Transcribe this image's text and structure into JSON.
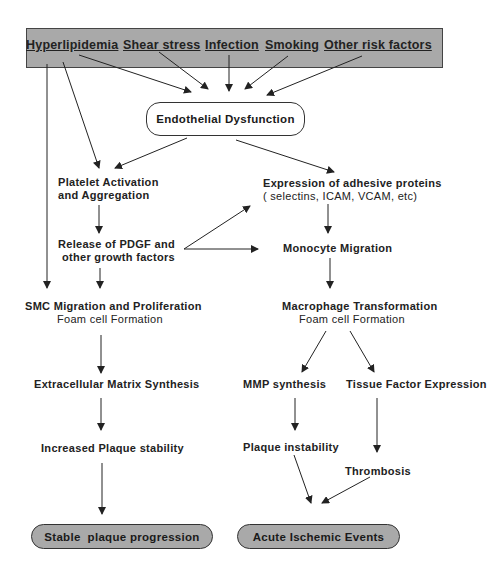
{
  "diagram": {
    "risk_factors": [
      {
        "label": "Hyperlipidemia"
      },
      {
        "label": "Shear stress"
      },
      {
        "label": "Infection"
      },
      {
        "label": "Smoking"
      },
      {
        "label": "Other risk factors"
      }
    ],
    "colors": {
      "box_fill": "#a9a9a9",
      "line": "#222222"
    },
    "endothelial": "Endothelial Dysfunction",
    "platelet": {
      "line1": "Platelet Activation",
      "line2": "and Aggregation"
    },
    "pdgf": {
      "line1": "Release of PDGF and",
      "line2": "other growth factors"
    },
    "adhesive": {
      "line1": "Expression of adhesive proteins",
      "line2": "( selectins, ICAM, VCAM, etc)"
    },
    "monocyte": "Monocyte Migration",
    "smc": {
      "line1": "SMC Migration and Proliferation",
      "line2": "Foam cell Formation"
    },
    "macrophage": {
      "line1": "Macrophage Transformation",
      "line2": "Foam cell Formation"
    },
    "ecm": "Extracellular Matrix Synthesis",
    "mmp": "MMP synthesis",
    "tissue_factor": "Tissue Factor Expression",
    "increased_stability": "Increased Plaque stability",
    "plaque_instability": "Plaque instability",
    "thrombosis": "Thrombosis",
    "stable_outcome": "Stable  plaque progression",
    "acute_outcome": "Acute Ischemic Events"
  }
}
